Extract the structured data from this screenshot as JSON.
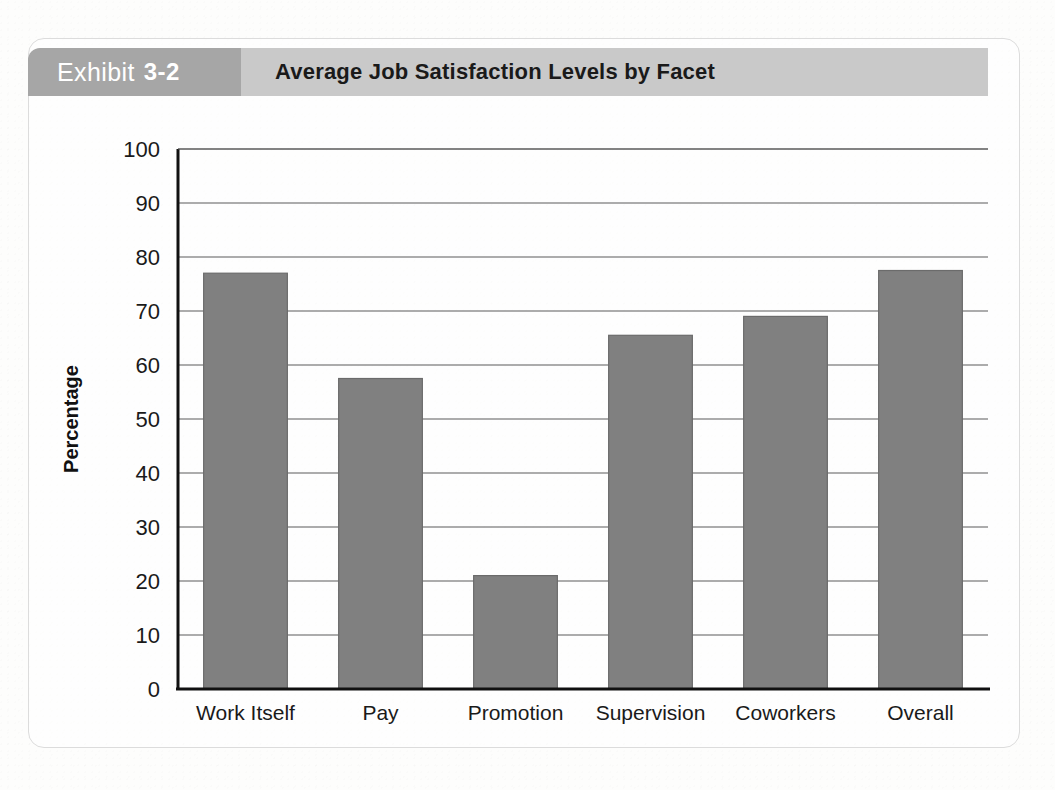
{
  "exhibit": {
    "badge_word": "Exhibit",
    "badge_number": "3-2",
    "title": "Average Job Satisfaction Levels by Facet",
    "badge_color": "#a6a6a6",
    "title_strip_color": "#c9c9c9",
    "bar_color": "#808080"
  },
  "chart_data": {
    "type": "bar",
    "title": "Average Job Satisfaction Levels by Facet",
    "categories": [
      "Work Itself",
      "Pay",
      "Promotion",
      "Supervision",
      "Coworkers",
      "Overall"
    ],
    "values": [
      77,
      57.5,
      21,
      65.5,
      69,
      77.5
    ],
    "xlabel": "",
    "ylabel": "Percentage",
    "ylim": [
      0,
      100
    ],
    "yticks": [
      0,
      10,
      20,
      30,
      40,
      50,
      60,
      70,
      80,
      90,
      100
    ],
    "ytick_labels": [
      "0",
      "10",
      "20",
      "30",
      "40",
      "50",
      "60",
      "70",
      "80",
      "90",
      "100"
    ],
    "grid": true,
    "legend": false,
    "series_color": "#808080"
  }
}
